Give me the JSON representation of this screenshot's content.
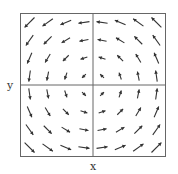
{
  "chart_data": {
    "type": "vector_field",
    "title": "",
    "xlabel": "x",
    "ylabel": "y",
    "field": "F(x, y) = (-y, x)",
    "xlim": [
      -2,
      2
    ],
    "ylim": [
      -2,
      2
    ],
    "grid_points": [
      -1.75,
      -1.25,
      -0.75,
      -0.25,
      0.25,
      0.75,
      1.25,
      1.75
    ],
    "rotation": "counter-clockwise",
    "axes_through_origin": true,
    "grid": false,
    "colors": {
      "frame": "#555555",
      "arrow": "#333333"
    }
  }
}
